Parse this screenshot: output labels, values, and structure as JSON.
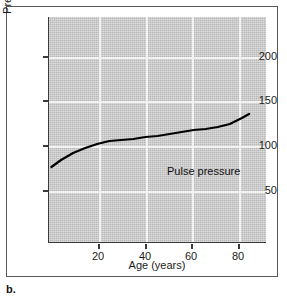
{
  "figure": {
    "caption": "b."
  },
  "chart_data": {
    "type": "line",
    "title": "",
    "xlabel": "Age (years)",
    "ylabel": "Pressure (mm Hg)",
    "xlim": [
      0,
      90
    ],
    "ylim": [
      0,
      225
    ],
    "xticks": [
      20,
      40,
      60,
      80
    ],
    "xtick_labels": [
      "20",
      "40",
      "60",
      "80"
    ],
    "yticks": [
      50,
      100,
      150,
      200
    ],
    "ytick_labels": [
      "50",
      "100",
      "150",
      "200"
    ],
    "grid": true,
    "grid_color": "#f2f2f2",
    "plot_background": "#b9b9b9",
    "legend_position": "inline-annotation",
    "series": [
      {
        "name": "Pulse pressure",
        "color": "#000000",
        "annotation": "Pulse pressure",
        "x": [
          1,
          5,
          10,
          15,
          20,
          25,
          30,
          35,
          40,
          45,
          50,
          55,
          60,
          65,
          70,
          75,
          80,
          83
        ],
        "y": [
          75,
          82,
          89,
          94,
          98,
          101,
          102,
          103,
          105,
          106,
          108,
          110,
          112,
          113,
          115,
          118,
          124,
          128
        ]
      }
    ]
  }
}
